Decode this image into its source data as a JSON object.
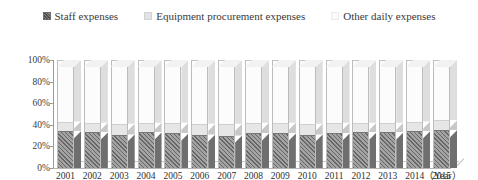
{
  "chart_data": {
    "type": "bar",
    "subtype": "100-percent-stacked-column-3d",
    "title": "",
    "xlabel": "（Year）",
    "ylabel": "",
    "ylim": [
      0,
      100
    ],
    "ytick_labels": [
      "100%",
      "80%",
      "60%",
      "40%",
      "20%",
      "0%"
    ],
    "ytick_values": [
      100,
      80,
      60,
      40,
      20,
      0
    ],
    "grid": false,
    "legend_position": "top-center",
    "categories": [
      "2001",
      "2002",
      "2003",
      "2004",
      "2005",
      "2006",
      "2007",
      "2008",
      "2009",
      "2010",
      "2011",
      "2012",
      "2013",
      "2014",
      "2015"
    ],
    "series": [
      {
        "name": "Staff expenses",
        "color": "#8f8f8f",
        "pattern": "diagonal-hatch",
        "values": [
          34,
          33,
          31,
          33,
          32,
          31,
          30,
          32,
          32,
          31,
          32,
          33,
          33,
          34,
          35
        ]
      },
      {
        "name": "Equipment procurement expenses",
        "color": "#e6e6e6",
        "pattern": "solid",
        "values": [
          9,
          9,
          10,
          9,
          10,
          10,
          11,
          10,
          10,
          10,
          10,
          9,
          9,
          9,
          9
        ]
      },
      {
        "name": "Other daily expenses",
        "color": "#fcfcfc",
        "pattern": "solid",
        "values": [
          57,
          58,
          59,
          58,
          58,
          59,
          59,
          58,
          58,
          59,
          58,
          58,
          58,
          57,
          56
        ]
      }
    ]
  },
  "legend": {
    "entries": [
      {
        "label": "Staff expenses",
        "swatch": "staff-swatch"
      },
      {
        "label": "Equipment procurement expenses",
        "swatch": "equipment-swatch"
      },
      {
        "label": "Other daily expenses",
        "swatch": "other-swatch"
      }
    ]
  },
  "axes": {
    "x_title": "（Year）"
  }
}
